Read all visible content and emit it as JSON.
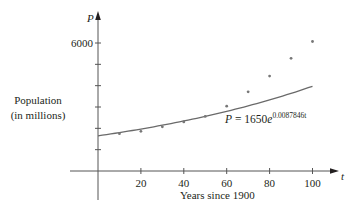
{
  "chart_data": {
    "type": "scatter",
    "title": "",
    "xlabel": "Years since 1900",
    "ylabel": "Population (in millions)",
    "ylabel_lines": [
      "Population",
      "(in millions)"
    ],
    "x_axis_variable": "t",
    "y_axis_variable": "P",
    "xlim": [
      0,
      110
    ],
    "ylim": [
      0,
      6500
    ],
    "x_ticks": [
      20,
      40,
      60,
      80,
      100
    ],
    "x_tick_labels": [
      "20",
      "40",
      "60",
      "80",
      "100"
    ],
    "y_ticks": [
      1000,
      2000,
      3000,
      4000,
      5000,
      6000
    ],
    "y_tick_labels": [
      "",
      "",
      "",
      "",
      "",
      "6000"
    ],
    "grid": false,
    "legend": null,
    "series": [
      {
        "name": "Population data",
        "kind": "scatter",
        "x": [
          10,
          20,
          30,
          40,
          50,
          60,
          70,
          80,
          90,
          100
        ],
        "y": [
          1750,
          1860,
          2070,
          2300,
          2560,
          3040,
          3710,
          4450,
          5280,
          6070
        ]
      },
      {
        "name": "Exponential model",
        "kind": "line",
        "equation": "P = 1650e^0.0087846t",
        "P0": 1650,
        "k": 0.0087846,
        "x_range": [
          0,
          100
        ]
      }
    ],
    "annotations": [
      {
        "text_base": "P = 1650e",
        "text_var": "P",
        "text_rest": " = 1650e",
        "text_exponent": "0.0087846t",
        "x": 60,
        "y": 2350
      }
    ]
  },
  "labels": {
    "y_var": "P",
    "x_var": "t",
    "ylabel_line1": "Population",
    "ylabel_line2": "(in millions)",
    "xlabel": "Years since 1900",
    "eq_var": "P",
    "eq_rest": " = 1650",
    "eq_e": "e",
    "eq_exp": "0.0087846t",
    "y_tick_6000": "6000"
  },
  "colors": {
    "axis": "#555555",
    "curve": "#6a6a6a",
    "points": "#777777",
    "text": "#231f20"
  }
}
